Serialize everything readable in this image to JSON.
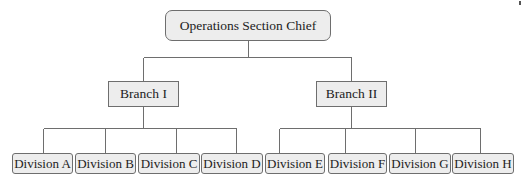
{
  "diagram": {
    "type": "org-chart",
    "colors": {
      "box_fill": "#ededed",
      "box_border": "#6e6e6e",
      "line": "#6e6e6e",
      "text": "#222222"
    },
    "root": {
      "label": "Operations Section Chief",
      "box": {
        "x": 165,
        "y": 10,
        "w": 166,
        "h": 31
      }
    },
    "branches": [
      {
        "label": "Branch I",
        "box": {
          "x": 108,
          "y": 81,
          "w": 71,
          "h": 26
        },
        "divisions": [
          {
            "label": "Division A",
            "box": {
              "x": 12,
              "y": 153,
              "w": 61,
              "h": 21
            }
          },
          {
            "label": "Division B",
            "box": {
              "x": 75,
              "y": 153,
              "w": 61,
              "h": 21
            }
          },
          {
            "label": "Division C",
            "box": {
              "x": 138,
              "y": 153,
              "w": 62,
              "h": 21
            }
          },
          {
            "label": "Division D",
            "box": {
              "x": 201,
              "y": 153,
              "w": 62,
              "h": 21
            }
          }
        ]
      },
      {
        "label": "Branch II",
        "box": {
          "x": 316,
          "y": 81,
          "w": 71,
          "h": 26
        },
        "divisions": [
          {
            "label": "Division E",
            "box": {
              "x": 265,
              "y": 153,
              "w": 60,
              "h": 21
            }
          },
          {
            "label": "Division F",
            "box": {
              "x": 328,
              "y": 153,
              "w": 59,
              "h": 21
            }
          },
          {
            "label": "Division G",
            "box": {
              "x": 389,
              "y": 153,
              "w": 62,
              "h": 21
            }
          },
          {
            "label": "Division H",
            "box": {
              "x": 452,
              "y": 153,
              "w": 62,
              "h": 21
            }
          }
        ]
      }
    ]
  }
}
